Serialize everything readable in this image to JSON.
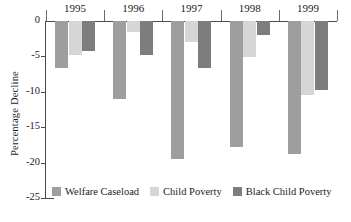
{
  "chart_data": {
    "type": "bar",
    "title": "",
    "subtitle": "",
    "xlabel": "",
    "ylabel": "Percentage Decline",
    "categories": [
      "1995",
      "1996",
      "1997",
      "1998",
      "1999"
    ],
    "ylim": [
      -25,
      0
    ],
    "yticks": [
      0,
      -5,
      -10,
      -15,
      -20,
      -25
    ],
    "ytick_labels": [
      "0",
      "-5",
      "-10",
      "-15",
      "-20",
      "-25"
    ],
    "grid": false,
    "legend_position": "bottom",
    "orientation": "vertical-negative",
    "series": [
      {
        "name": "Welfare Caseload",
        "color": "#9e9e9e",
        "values": [
          -6.7,
          -11.0,
          -19.5,
          -17.8,
          -18.8
        ]
      },
      {
        "name": "Child Poverty",
        "color": "#d6d6d6",
        "values": [
          -4.8,
          -1.6,
          -2.9,
          -5.1,
          -10.5
        ]
      },
      {
        "name": "Black Child Poverty",
        "color": "#7d7d7d",
        "values": [
          -4.3,
          -4.8,
          -6.7,
          -2.0,
          -9.8
        ]
      }
    ]
  },
  "axis": {
    "line_color": "#4a4a4a",
    "text_color": "#1b1b1b"
  }
}
